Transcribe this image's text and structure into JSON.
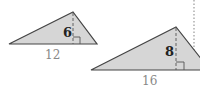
{
  "diagram": {
    "triangles": [
      {
        "id": "small",
        "height_label": "6",
        "base_label": "12",
        "fill": "#d6d6d6",
        "stroke": "#444444"
      },
      {
        "id": "large",
        "height_label": "8",
        "base_label": "16",
        "fill": "#d6d6d6",
        "stroke": "#444444"
      }
    ]
  }
}
